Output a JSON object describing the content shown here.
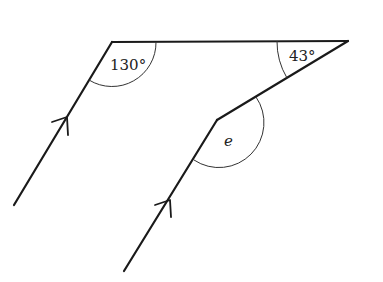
{
  "diagram": {
    "type": "geometry-parallel-lines-angles",
    "labels": {
      "angle_top_left": "130°",
      "angle_top_right": "43°",
      "angle_unknown": "e"
    }
  }
}
